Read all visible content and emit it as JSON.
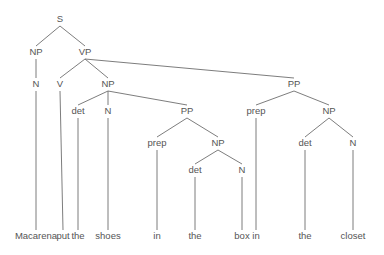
{
  "diagram": {
    "type": "parse-tree",
    "sentence": "Macarena put the shoes in the box in the closet",
    "nodes": [
      {
        "id": "S",
        "label": "S",
        "x": 60,
        "y": 22
      },
      {
        "id": "NP1",
        "label": "NP",
        "x": 36,
        "y": 55
      },
      {
        "id": "VP",
        "label": "VP",
        "x": 85,
        "y": 55
      },
      {
        "id": "N1",
        "label": "N",
        "x": 36,
        "y": 87
      },
      {
        "id": "V",
        "label": "V",
        "x": 60,
        "y": 87
      },
      {
        "id": "NP2",
        "label": "NP",
        "x": 108,
        "y": 87
      },
      {
        "id": "PP2",
        "label": "PP",
        "x": 294,
        "y": 87
      },
      {
        "id": "det1",
        "label": "det",
        "x": 78,
        "y": 114
      },
      {
        "id": "N2",
        "label": "N",
        "x": 108,
        "y": 114
      },
      {
        "id": "PP1",
        "label": "PP",
        "x": 187,
        "y": 114
      },
      {
        "id": "prep2",
        "label": "prep",
        "x": 256,
        "y": 114
      },
      {
        "id": "NP4",
        "label": "NP",
        "x": 329,
        "y": 114
      },
      {
        "id": "prep1",
        "label": "prep",
        "x": 157,
        "y": 146
      },
      {
        "id": "NP3",
        "label": "NP",
        "x": 218,
        "y": 146
      },
      {
        "id": "det3",
        "label": "det",
        "x": 305,
        "y": 146
      },
      {
        "id": "N4",
        "label": "N",
        "x": 353,
        "y": 146
      },
      {
        "id": "det2",
        "label": "det",
        "x": 195,
        "y": 173
      },
      {
        "id": "N3",
        "label": "N",
        "x": 242,
        "y": 173
      }
    ],
    "words": [
      {
        "id": "w1",
        "label": "Macarena",
        "x": 36,
        "y": 239,
        "parent": "N1"
      },
      {
        "id": "w2",
        "label": "put",
        "x": 63,
        "y": 239,
        "parent": "V"
      },
      {
        "id": "w3",
        "label": "the",
        "x": 78,
        "y": 239,
        "parent": "det1"
      },
      {
        "id": "w4",
        "label": "shoes",
        "x": 108,
        "y": 239,
        "parent": "N2"
      },
      {
        "id": "w5",
        "label": "in",
        "x": 157,
        "y": 239,
        "parent": "prep1"
      },
      {
        "id": "w6",
        "label": "the",
        "x": 195,
        "y": 239,
        "parent": "det2"
      },
      {
        "id": "w7",
        "label": "box",
        "x": 242,
        "y": 239,
        "parent": "N3"
      },
      {
        "id": "w8",
        "label": "in",
        "x": 256,
        "y": 239,
        "parent": "prep2"
      },
      {
        "id": "w9",
        "label": "the",
        "x": 305,
        "y": 239,
        "parent": "det3"
      },
      {
        "id": "w10",
        "label": "closet",
        "x": 353,
        "y": 239,
        "parent": "N4"
      }
    ],
    "edges": [
      [
        "S",
        "NP1"
      ],
      [
        "S",
        "VP"
      ],
      [
        "NP1",
        "N1"
      ],
      [
        "VP",
        "V"
      ],
      [
        "VP",
        "NP2"
      ],
      [
        "VP",
        "PP2"
      ],
      [
        "NP2",
        "det1"
      ],
      [
        "NP2",
        "N2"
      ],
      [
        "NP2",
        "PP1"
      ],
      [
        "PP1",
        "prep1"
      ],
      [
        "PP1",
        "NP3"
      ],
      [
        "NP3",
        "det2"
      ],
      [
        "NP3",
        "N3"
      ],
      [
        "PP2",
        "prep2"
      ],
      [
        "PP2",
        "NP4"
      ],
      [
        "NP4",
        "det3"
      ],
      [
        "NP4",
        "N4"
      ]
    ],
    "colors": {
      "line": "#6e6e6e",
      "text": "#555555",
      "background": "#ffffff"
    }
  }
}
